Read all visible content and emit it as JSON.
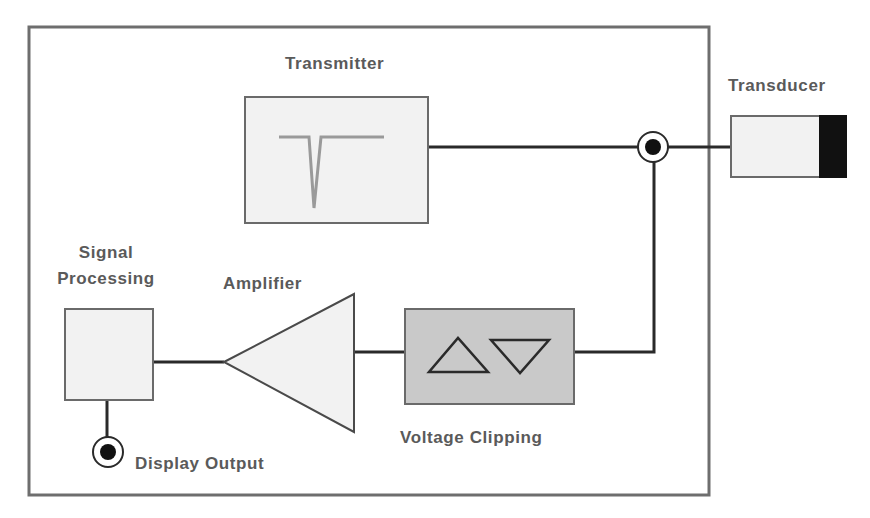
{
  "diagram": {
    "colors": {
      "frame": "#6e6e6e",
      "wire": "#2a2a2a",
      "box_light_fill": "#f2f2f2",
      "box_dark_fill": "#c9c9c9",
      "box_stroke": "#6a6a6a",
      "pulse_stroke": "#9a9a9a",
      "transducer_face": "#111111",
      "label_text": "#5a5a5a"
    },
    "labels": {
      "transmitter": "Transmitter",
      "transducer": "Transducer",
      "signal_processing_line1": "Signal",
      "signal_processing_line2": "Processing",
      "amplifier": "Amplifier",
      "voltage_clipping": "Voltage Clipping",
      "display_output": "Display Output"
    },
    "blocks": [
      {
        "id": "transmitter",
        "label": "Transmitter",
        "shape": "rect",
        "icon": "negative-pulse-icon"
      },
      {
        "id": "transducer",
        "label": "Transducer",
        "shape": "rect-with-dark-face"
      },
      {
        "id": "signal-processing",
        "label": "Signal Processing",
        "shape": "rect"
      },
      {
        "id": "amplifier",
        "label": "Amplifier",
        "shape": "triangle-left"
      },
      {
        "id": "voltage-clipping",
        "label": "Voltage Clipping",
        "shape": "rect",
        "icon": "up-down-triangles-icon"
      },
      {
        "id": "display-output",
        "label": "Display Output",
        "shape": "connector"
      },
      {
        "id": "junction",
        "label": "",
        "shape": "connector"
      }
    ],
    "connections": [
      {
        "from": "transmitter",
        "to": "junction"
      },
      {
        "from": "junction",
        "to": "transducer"
      },
      {
        "from": "junction",
        "to": "voltage-clipping"
      },
      {
        "from": "voltage-clipping",
        "to": "amplifier"
      },
      {
        "from": "amplifier",
        "to": "signal-processing"
      },
      {
        "from": "signal-processing",
        "to": "display-output"
      }
    ]
  }
}
